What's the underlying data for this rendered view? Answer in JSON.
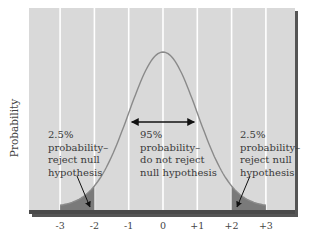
{
  "chart_data": {
    "type": "area",
    "title": "",
    "xlabel": "",
    "ylabel": "Probability",
    "x_ticks": [
      "-3",
      "-2",
      "-1",
      "0",
      "+1",
      "+2",
      "+3"
    ],
    "x_tick_values": [
      -3,
      -2,
      -1,
      0,
      1,
      2,
      3
    ],
    "xlim": [
      -3.9,
      3.9
    ],
    "grid": {
      "vertical": true,
      "horizontal": false
    },
    "series": [
      {
        "name": "Normal distribution",
        "function": "standard normal pdf",
        "x_range": [
          -3,
          3
        ]
      }
    ],
    "shaded_regions": [
      {
        "from": -3,
        "to": -2,
        "label": "2.5% probability– reject null hypothesis"
      },
      {
        "from": 2,
        "to": 3,
        "label": "2.5% probability– reject null hypothesis"
      }
    ],
    "annotations": [
      {
        "text": "95% probability– do not reject null hypothesis",
        "arrow": "double",
        "from": -1,
        "to": 1
      },
      {
        "text": "2.5% probability– reject null hypothesis",
        "arrow_to": -2.1,
        "side": "left"
      },
      {
        "text": "2.5% probability– reject null hypothesis",
        "arrow_to": 2.1,
        "side": "right"
      }
    ],
    "colors": {
      "plot_background": "#d9d9d9",
      "grid": "#ffffff",
      "curve": "#8a8a8a",
      "tail_fill": "#7a7a7a",
      "frame_shadow": "#555555"
    }
  },
  "labels": {
    "ylabel": "Probability",
    "left_note": "2.5%\nprobability–\nreject null\nhypothesis",
    "center_note": "95%\nprobability–\ndo not reject\nnull hypothesis",
    "right_note": "2.5%\nprobability–\nreject null\nhypothesis"
  }
}
